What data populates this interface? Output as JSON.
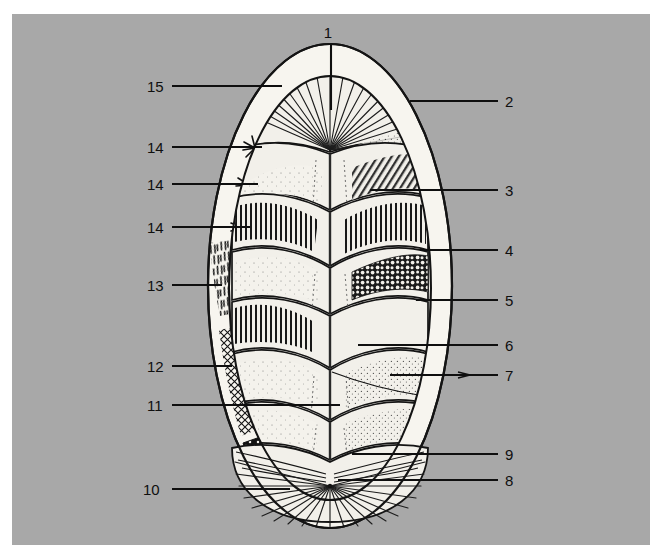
{
  "figure": {
    "panel_background_color": "#a8a8a8",
    "page_background_color": "#ffffff",
    "ink_color": "#111111",
    "shell_fill_color": "#f2f0ea",
    "girdle_fill_color": "#f7f5ef",
    "dark_girdle_color": "#141414",
    "panel": {
      "x": 12,
      "y": 14,
      "width": 638,
      "height": 531
    }
  },
  "callouts": [
    {
      "id": "1",
      "label": "1",
      "side": "top",
      "text_x": 328,
      "text_y": 38,
      "line": [
        [
          331,
          44
        ],
        [
          331,
          110
        ]
      ]
    },
    {
      "id": "2",
      "label": "2",
      "side": "right",
      "text_x": 505,
      "text_y": 107,
      "line": [
        [
          410,
          101
        ],
        [
          498,
          101
        ]
      ]
    },
    {
      "id": "3",
      "label": "3",
      "side": "right",
      "text_x": 505,
      "text_y": 196,
      "line": [
        [
          370,
          190
        ],
        [
          498,
          190
        ]
      ]
    },
    {
      "id": "4",
      "label": "4",
      "side": "right",
      "text_x": 505,
      "text_y": 256,
      "line": [
        [
          420,
          250
        ],
        [
          498,
          250
        ]
      ]
    },
    {
      "id": "5",
      "label": "5",
      "side": "right",
      "text_x": 505,
      "text_y": 306,
      "line": [
        [
          416,
          300
        ],
        [
          498,
          300
        ]
      ]
    },
    {
      "id": "6",
      "label": "6",
      "side": "right",
      "text_x": 505,
      "text_y": 351,
      "line": [
        [
          358,
          345
        ],
        [
          498,
          345
        ]
      ]
    },
    {
      "id": "7",
      "label": "7",
      "side": "right",
      "text_x": 505,
      "text_y": 381,
      "line": [
        [
          390,
          375
        ],
        [
          498,
          375
        ]
      ]
    },
    {
      "id": "8",
      "label": "8",
      "side": "right",
      "text_x": 505,
      "text_y": 486,
      "line": [
        [
          338,
          480
        ],
        [
          498,
          480
        ]
      ]
    },
    {
      "id": "9",
      "label": "9",
      "side": "right",
      "text_x": 505,
      "text_y": 460,
      "line": [
        [
          352,
          454
        ],
        [
          498,
          454
        ]
      ]
    },
    {
      "id": "10",
      "label": "10",
      "side": "left",
      "text_x": 143,
      "text_y": 495,
      "line": [
        [
          172,
          489
        ],
        [
          290,
          489
        ]
      ]
    },
    {
      "id": "11",
      "label": "11",
      "side": "left",
      "text_x": 147,
      "text_y": 411,
      "line": [
        [
          172,
          405
        ],
        [
          340,
          405
        ]
      ]
    },
    {
      "id": "12",
      "label": "12",
      "side": "left",
      "text_x": 147,
      "text_y": 372,
      "line": [
        [
          172,
          366
        ],
        [
          232,
          366
        ]
      ]
    },
    {
      "id": "13",
      "label": "13",
      "side": "left",
      "text_x": 147,
      "text_y": 291,
      "line": [
        [
          172,
          285
        ],
        [
          222,
          285
        ]
      ]
    },
    {
      "id": "14",
      "label": "14",
      "side": "left",
      "text_x": 147,
      "text_y": 233,
      "line": [
        [
          172,
          227
        ],
        [
          250,
          227
        ]
      ]
    },
    {
      "id": "14b",
      "label": "14",
      "side": "left",
      "text_x": 147,
      "text_y": 190,
      "line": [
        [
          172,
          184
        ],
        [
          258,
          184
        ]
      ]
    },
    {
      "id": "14c",
      "label": "14",
      "side": "left",
      "text_x": 147,
      "text_y": 153,
      "line": [
        [
          172,
          147
        ],
        [
          262,
          147
        ]
      ]
    },
    {
      "id": "15",
      "label": "15",
      "side": "left",
      "text_x": 147,
      "text_y": 92,
      "line": [
        [
          172,
          86
        ],
        [
          282,
          86
        ]
      ]
    }
  ],
  "anatomy": {
    "girdle_outer": "oval-outline",
    "valve_count": 8,
    "head_valve": "anterior-radiating-fan",
    "tail_valve": "posterior-radiating-fan-with-mucro",
    "textures": [
      "radiating-ribs",
      "stippled-shading",
      "vertical-ribbing",
      "granular-pustules",
      "cross-hatch-scales",
      "bristle-spicules",
      "solid-black-with-white-dots",
      "rosette-spicule-tufts"
    ]
  }
}
